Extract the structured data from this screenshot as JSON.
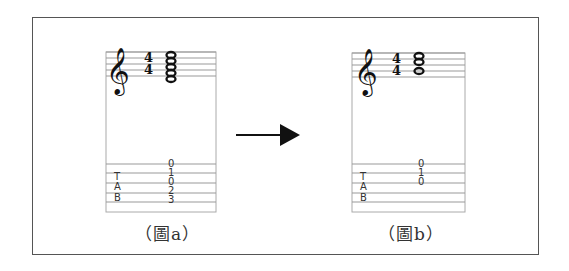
{
  "figures": [
    {
      "id": "a",
      "caption": "（圖a）",
      "time_signature": {
        "top": "4",
        "bottom": "4"
      },
      "clef": "treble",
      "notation": "stacked whole-note chord (5 notes)",
      "tab": {
        "label": [
          "T",
          "A",
          "B"
        ],
        "numbers": [
          "0",
          "1",
          "0",
          "2",
          "3"
        ]
      }
    },
    {
      "id": "b",
      "caption": "（圖b）",
      "time_signature": {
        "top": "4",
        "bottom": "4"
      },
      "clef": "treble",
      "notation": "stacked whole-note chord (3 notes)",
      "tab": {
        "label": [
          "T",
          "A",
          "B"
        ],
        "numbers": [
          "0",
          "1",
          "0"
        ]
      }
    }
  ],
  "arrow": {
    "direction": "right",
    "meaning": "a transforms to b"
  },
  "glyphs": {
    "treble_clef": "𝄞",
    "whole_note": "𝅝"
  }
}
